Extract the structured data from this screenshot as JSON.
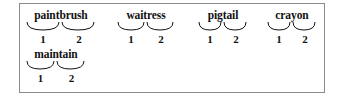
{
  "frame": {
    "border_color": "#8a8a8a",
    "background_color": "#ffffff"
  },
  "exercise": {
    "morpheme_numbers": [
      "1",
      "2"
    ],
    "words": [
      {
        "id": "paintbrush",
        "text": "paintbrush",
        "morphemes": [
          "paint",
          "brush"
        ],
        "numbers": [
          "1",
          "2"
        ],
        "row": 1,
        "column": 1
      },
      {
        "id": "waitress",
        "text": "waitress",
        "morphemes": [
          "wait",
          "ress"
        ],
        "numbers": [
          "1",
          "2"
        ],
        "row": 1,
        "column": 2
      },
      {
        "id": "pigtail",
        "text": "pigtail",
        "morphemes": [
          "pig",
          "tail"
        ],
        "numbers": [
          "1",
          "2"
        ],
        "row": 1,
        "column": 3
      },
      {
        "id": "crayon",
        "text": "crayon",
        "morphemes": [
          "cray",
          "on"
        ],
        "numbers": [
          "1",
          "2"
        ],
        "row": 1,
        "column": 4
      },
      {
        "id": "maintain",
        "text": "maintain",
        "morphemes": [
          "main",
          "tain"
        ],
        "numbers": [
          "1",
          "2"
        ],
        "row": 2,
        "column": 1
      }
    ]
  }
}
